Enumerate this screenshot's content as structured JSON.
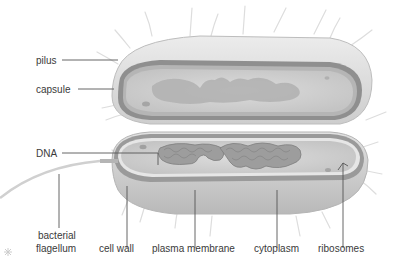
{
  "diagram": {
    "labels": {
      "pilus": "pilus",
      "capsule": "capsule",
      "dna": "DNA",
      "flagellum_line1": "bacterial",
      "flagellum_line2": "flagellum",
      "cell_wall": "cell wall",
      "plasma_membrane": "plasma membrane",
      "cytoplasm": "cytoplasm",
      "ribosomes": "ribosomes"
    },
    "colors": {
      "outer_shell": "#d9d9d9",
      "capsule_band": "#8f8f8f",
      "cytoplasm": "#cfcfcf",
      "nucleoid": "#a9a9a9",
      "leader_line": "#555555",
      "label_text": "#3a3a3a"
    }
  }
}
